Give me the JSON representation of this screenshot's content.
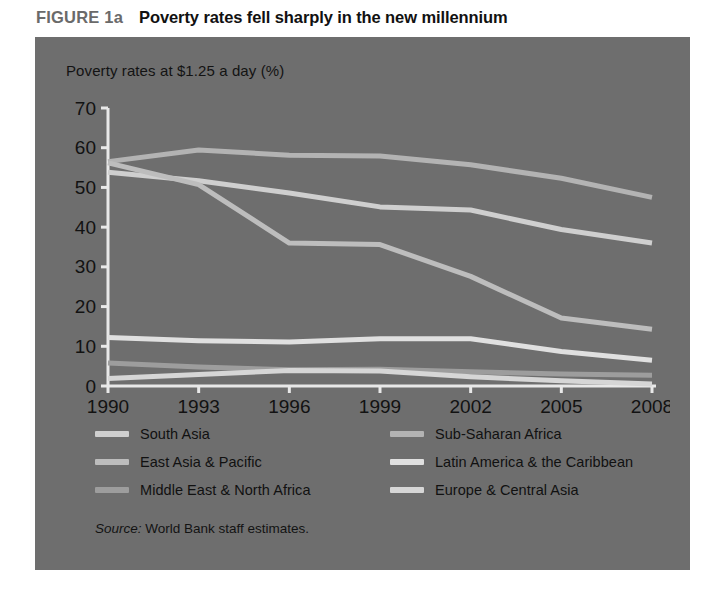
{
  "figure": {
    "number": "FIGURE 1a",
    "title": "Poverty rates fell sharply in the new millennium",
    "subtitle": "Poverty rates at $1.25 a day (%)",
    "source_word": "Source:",
    "source_text": " World Bank staff estimates."
  },
  "colors": {
    "panel_background": "#6e6e6e",
    "axis": "#e8e8e8",
    "title_text": "#111111",
    "figure_number_text": "#6a6a6a",
    "series_south_asia": "#cfcfcf",
    "series_east_asia_pacific": "#bdbdbd",
    "series_middle_east_north_africa": "#9d9d9d",
    "series_sub_saharan_africa": "#b3b3b3",
    "series_latin_america_caribbean": "#e0e0e0",
    "series_europe_central_asia": "#d6d6d6"
  },
  "chart_data": {
    "type": "line",
    "title": "Poverty rates fell sharply in the new millennium",
    "subtitle": "Poverty rates at $1.25 a day (%)",
    "xlabel": "",
    "ylabel": "Poverty rates at $1.25 a day (%)",
    "x": [
      1990,
      1993,
      1996,
      1999,
      2002,
      2005,
      2008
    ],
    "xtick_labels": [
      "1990",
      "1993",
      "1996",
      "1999",
      "2002",
      "2005",
      "2008"
    ],
    "ytick_labels": [
      "0",
      "10",
      "20",
      "30",
      "40",
      "50",
      "60",
      "70"
    ],
    "yticks": [
      0,
      10,
      20,
      30,
      40,
      50,
      60,
      70
    ],
    "ylim": [
      0,
      70
    ],
    "xlim": [
      1990,
      2008
    ],
    "grid": false,
    "legend_position": "below-axes",
    "series": [
      {
        "name": "Sub-Saharan Africa",
        "color": "#b3b3b3",
        "values": [
          56.5,
          59.4,
          58.1,
          57.9,
          55.7,
          52.3,
          47.5
        ]
      },
      {
        "name": "South Asia",
        "color": "#cfcfcf",
        "values": [
          53.8,
          51.7,
          48.6,
          45.1,
          44.3,
          39.4,
          36.0
        ]
      },
      {
        "name": "East Asia & Pacific",
        "color": "#bdbdbd",
        "values": [
          56.2,
          50.7,
          36.0,
          35.6,
          27.6,
          17.1,
          14.3
        ]
      },
      {
        "name": "Latin America & the Caribbean",
        "color": "#e0e0e0",
        "values": [
          12.2,
          11.4,
          11.1,
          11.9,
          11.9,
          8.7,
          6.5
        ]
      },
      {
        "name": "Middle East & North Africa",
        "color": "#9d9d9d",
        "values": [
          5.8,
          4.8,
          4.1,
          4.2,
          3.6,
          3.0,
          2.7
        ]
      },
      {
        "name": "Europe & Central Asia",
        "color": "#d6d6d6",
        "values": [
          1.9,
          2.9,
          3.9,
          3.8,
          2.3,
          1.3,
          0.5
        ]
      }
    ]
  },
  "legend": {
    "column_left": [
      {
        "label": "South Asia",
        "color": "#cfcfcf"
      },
      {
        "label": "East Asia & Pacific",
        "color": "#bdbdbd"
      },
      {
        "label": "Middle East & North Africa",
        "color": "#9d9d9d"
      }
    ],
    "column_right": [
      {
        "label": "Sub-Saharan Africa",
        "color": "#b3b3b3"
      },
      {
        "label": "Latin America & the Caribbean",
        "color": "#e0e0e0"
      },
      {
        "label": "Europe & Central Asia",
        "color": "#d6d6d6"
      }
    ]
  }
}
